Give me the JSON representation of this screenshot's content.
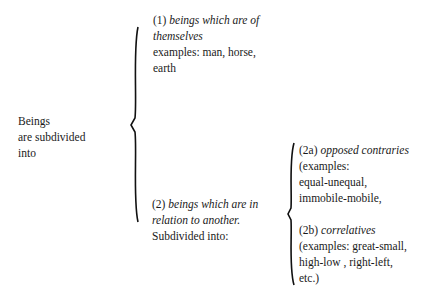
{
  "root": {
    "lines": [
      "Beings",
      "are  subdivided",
      "into"
    ]
  },
  "node1": {
    "number": "(1)",
    "title_line1": "beings which are of",
    "title_line2": "themselves",
    "examples_line1": "examples: man, horse,",
    "examples_line2": "earth"
  },
  "node2": {
    "number": "(2)",
    "title_line1": "beings which are in",
    "title_line2": "relation to another.",
    "note": "Subdivided  into:"
  },
  "node2a": {
    "number": "(2a)",
    "title": "opposed  contraries",
    "lines": [
      "(examples:",
      "equal-unequal,",
      "immobile-mobile,"
    ]
  },
  "node2b": {
    "number": "(2b)",
    "title": "correlatives",
    "lines": [
      "(examples:  great-small,",
      "high-low ,  right-left,",
      "etc.)"
    ]
  },
  "braces": [
    {
      "name": "brace-root",
      "top": 27,
      "bottom": 222,
      "mid": 125,
      "x": 136
    },
    {
      "name": "brace-2",
      "top": 143,
      "bottom": 285,
      "mid": 214,
      "x": 291
    }
  ]
}
